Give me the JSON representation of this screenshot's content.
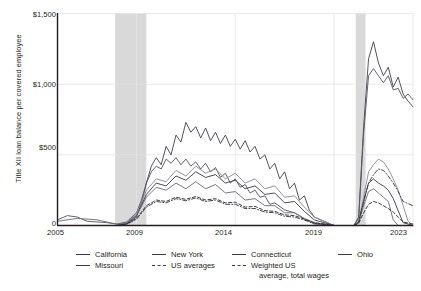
{
  "chart_data": {
    "type": "line",
    "title": "",
    "xlabel": "",
    "ylabel": "Title XII loan balance per covered employee",
    "xlim": [
      2005,
      2023
    ],
    "ylim": [
      0,
      1500
    ],
    "yticks": [
      0,
      500,
      1000,
      1500
    ],
    "ytick_labels": [
      "0",
      "$500",
      "$1,000",
      "$1,500"
    ],
    "xticks": [
      2005,
      2009,
      2014,
      2019,
      2023
    ],
    "xtick_labels": [
      "2005",
      "2009",
      "2014",
      "2019",
      "2023"
    ],
    "grid": "horizontal-and-vertical-light",
    "legend_position": "below-plot",
    "shaded_regions": [
      {
        "label": "recession",
        "x0": 2007.92,
        "x1": 2009.5,
        "color": "#d9d9d9"
      },
      {
        "label": "recession",
        "x0": 2020.1,
        "x1": 2020.6,
        "color": "#d9d9d9"
      }
    ],
    "series": [
      {
        "name": "California",
        "style": "solid",
        "color": "#4a4a55",
        "x": [
          2005.0,
          2005.5,
          2006.0,
          2006.5,
          2007.0,
          2007.5,
          2008.0,
          2008.5,
          2009.0,
          2009.25,
          2009.5,
          2009.75,
          2010.0,
          2010.25,
          2010.5,
          2010.75,
          2011.0,
          2011.25,
          2011.5,
          2011.75,
          2012.0,
          2012.25,
          2012.5,
          2012.75,
          2013.0,
          2013.25,
          2013.5,
          2013.75,
          2014.0,
          2014.25,
          2014.5,
          2014.75,
          2015.0,
          2015.25,
          2015.5,
          2015.75,
          2016.0,
          2016.25,
          2016.5,
          2016.75,
          2017.0,
          2017.25,
          2017.5,
          2017.75,
          2018.0,
          2019.0,
          2020.0,
          2020.25,
          2020.5,
          2020.75,
          2021.0,
          2021.25,
          2021.5,
          2021.75,
          2022.0,
          2022.25,
          2022.5,
          2022.75,
          2023.0
        ],
        "y": [
          0,
          0,
          0,
          0,
          0,
          0,
          0,
          12,
          60,
          160,
          300,
          420,
          480,
          430,
          560,
          500,
          640,
          590,
          730,
          660,
          700,
          620,
          690,
          600,
          660,
          580,
          640,
          560,
          610,
          540,
          600,
          520,
          560,
          470,
          500,
          400,
          440,
          330,
          380,
          260,
          300,
          180,
          210,
          110,
          60,
          0,
          0,
          60,
          700,
          1180,
          1300,
          1150,
          1060,
          1120,
          980,
          1050,
          930,
          880,
          840
        ]
      },
      {
        "name": "New York",
        "style": "solid",
        "color": "#5a5a63",
        "x": [
          2005.0,
          2005.5,
          2006.0,
          2006.5,
          2007.0,
          2007.5,
          2008.0,
          2008.5,
          2009.0,
          2009.25,
          2009.5,
          2009.75,
          2010.0,
          2010.25,
          2010.5,
          2010.75,
          2011.0,
          2011.25,
          2011.5,
          2011.75,
          2012.0,
          2012.25,
          2012.5,
          2012.75,
          2013.0,
          2013.25,
          2013.5,
          2013.75,
          2014.0,
          2014.25,
          2014.5,
          2014.75,
          2015.0,
          2015.25,
          2015.5,
          2015.75,
          2016.0,
          2016.5,
          2017.0,
          2017.5,
          2018.0,
          2019.0,
          2020.0,
          2020.25,
          2020.5,
          2020.75,
          2021.0,
          2021.25,
          2021.5,
          2021.75,
          2022.0,
          2022.25,
          2022.5,
          2022.75,
          2023.0
        ],
        "y": [
          40,
          70,
          60,
          30,
          25,
          20,
          10,
          25,
          90,
          180,
          300,
          380,
          420,
          400,
          470,
          440,
          480,
          430,
          470,
          420,
          450,
          400,
          440,
          380,
          410,
          340,
          370,
          300,
          330,
          270,
          290,
          230,
          250,
          200,
          210,
          150,
          160,
          110,
          90,
          50,
          20,
          0,
          0,
          50,
          650,
          1060,
          1110,
          1060,
          1010,
          1060,
          960,
          970,
          900,
          930,
          890
        ]
      },
      {
        "name": "Connecticut",
        "style": "solid",
        "color": "#8d8d97",
        "x": [
          2005.0,
          2006.0,
          2007.0,
          2008.0,
          2008.5,
          2009.0,
          2009.5,
          2010.0,
          2010.5,
          2011.0,
          2011.5,
          2012.0,
          2012.5,
          2013.0,
          2013.5,
          2014.0,
          2014.5,
          2015.0,
          2015.5,
          2016.0,
          2016.5,
          2017.0,
          2017.5,
          2018.0,
          2019.0,
          2020.0,
          2020.25,
          2020.5,
          2020.75,
          2021.0,
          2021.25,
          2021.5,
          2021.75,
          2022.0,
          2022.25,
          2022.5,
          2022.75,
          2023.0
        ],
        "y": [
          0,
          0,
          0,
          0,
          20,
          80,
          250,
          330,
          310,
          390,
          350,
          420,
          370,
          400,
          330,
          370,
          300,
          330,
          260,
          280,
          200,
          210,
          130,
          60,
          0,
          0,
          30,
          200,
          380,
          430,
          470,
          450,
          400,
          330,
          250,
          140,
          30,
          0
        ]
      },
      {
        "name": "Ohio",
        "style": "solid",
        "color": "#42424c",
        "x": [
          2005.0,
          2006.0,
          2007.0,
          2008.0,
          2008.5,
          2009.0,
          2009.5,
          2010.0,
          2010.5,
          2011.0,
          2011.5,
          2012.0,
          2012.5,
          2013.0,
          2013.5,
          2014.0,
          2014.5,
          2015.0,
          2015.5,
          2016.0,
          2016.5,
          2017.0,
          2017.5,
          2018.0,
          2019.0,
          2020.0,
          2020.25,
          2020.5,
          2020.75,
          2021.0,
          2021.25,
          2021.5,
          2021.75,
          2022.0,
          2022.5,
          2023.0
        ],
        "y": [
          0,
          0,
          0,
          0,
          15,
          70,
          220,
          300,
          280,
          350,
          320,
          380,
          340,
          360,
          300,
          320,
          260,
          280,
          220,
          230,
          160,
          170,
          100,
          40,
          0,
          0,
          25,
          170,
          300,
          330,
          300,
          280,
          250,
          190,
          20,
          0
        ]
      },
      {
        "name": "Missouri",
        "style": "solid",
        "color": "#6f6f79",
        "x": [
          2005.0,
          2006.0,
          2007.0,
          2008.0,
          2008.5,
          2009.0,
          2009.5,
          2010.0,
          2010.5,
          2011.0,
          2011.5,
          2012.0,
          2012.5,
          2013.0,
          2013.5,
          2014.0,
          2014.5,
          2015.0,
          2015.5,
          2016.0,
          2016.5,
          2017.0,
          2017.5,
          2018.0,
          2019.0,
          2020.0,
          2020.25,
          2020.5,
          2020.75,
          2021.0,
          2021.25,
          2021.5,
          2021.75,
          2022.0,
          2022.25,
          2023.0
        ],
        "y": [
          30,
          50,
          40,
          10,
          20,
          70,
          200,
          270,
          250,
          300,
          260,
          310,
          260,
          290,
          230,
          240,
          180,
          190,
          140,
          140,
          90,
          90,
          45,
          10,
          0,
          0,
          20,
          140,
          240,
          260,
          230,
          200,
          170,
          40,
          0,
          0
        ]
      },
      {
        "name": "US averages",
        "style": "dashed",
        "color": "#2f2f38",
        "x": [
          2005.0,
          2006.0,
          2007.0,
          2008.0,
          2008.5,
          2009.0,
          2009.5,
          2010.0,
          2010.5,
          2011.0,
          2011.5,
          2012.0,
          2012.5,
          2013.0,
          2013.5,
          2014.0,
          2014.5,
          2015.0,
          2015.5,
          2016.0,
          2016.5,
          2017.0,
          2017.5,
          2018.0,
          2019.0,
          2020.0,
          2020.25,
          2020.5,
          2020.75,
          2021.0,
          2021.25,
          2021.5,
          2021.75,
          2022.0,
          2022.25,
          2022.5,
          2023.0
        ],
        "y": [
          0,
          0,
          0,
          0,
          10,
          50,
          140,
          180,
          170,
          200,
          185,
          205,
          180,
          190,
          160,
          165,
          130,
          135,
          105,
          100,
          75,
          70,
          45,
          20,
          0,
          0,
          15,
          90,
          150,
          170,
          160,
          140,
          120,
          95,
          60,
          25,
          10
        ]
      },
      {
        "name": "Weighted US average, total wages",
        "style": "dashdot",
        "color": "#3a3a44",
        "x": [
          2005.0,
          2006.0,
          2007.0,
          2008.0,
          2008.5,
          2009.0,
          2009.5,
          2010.0,
          2010.5,
          2011.0,
          2011.5,
          2012.0,
          2012.5,
          2013.0,
          2013.5,
          2014.0,
          2014.5,
          2015.0,
          2015.5,
          2016.0,
          2016.5,
          2017.0,
          2017.5,
          2018.0,
          2019.0,
          2020.0,
          2020.25,
          2020.5,
          2020.75,
          2021.0,
          2021.25,
          2021.5,
          2021.75,
          2022.0,
          2022.25,
          2022.5,
          2023.0
        ],
        "y": [
          0,
          0,
          0,
          0,
          8,
          45,
          130,
          170,
          160,
          190,
          175,
          195,
          170,
          180,
          150,
          150,
          120,
          120,
          95,
          90,
          65,
          60,
          38,
          15,
          0,
          0,
          25,
          170,
          300,
          360,
          400,
          390,
          350,
          300,
          240,
          170,
          140
        ]
      }
    ]
  },
  "legend": {
    "items": [
      {
        "label": "California",
        "style": "solid"
      },
      {
        "label": "New York",
        "style": "solid"
      },
      {
        "label": "Connecticut",
        "style": "solid"
      },
      {
        "label": "Ohio",
        "style": "solid"
      },
      {
        "label": "Missouri",
        "style": "solid"
      },
      {
        "label": "US averages",
        "style": "dashed"
      },
      {
        "label": "Weighted US",
        "label2": "average, total wages",
        "style": "dashdot"
      }
    ]
  }
}
